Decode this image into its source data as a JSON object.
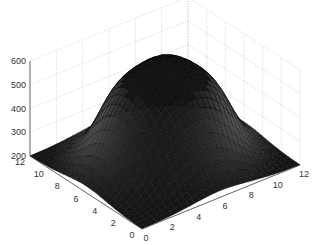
{
  "chart_data": {
    "type": "surface3d",
    "title": "",
    "xlabel": "",
    "ylabel": "",
    "zlabel": "",
    "x_ticks": [
      0,
      2,
      4,
      6,
      8,
      10,
      12
    ],
    "y_ticks": [
      0,
      2,
      4,
      6,
      8,
      10,
      12
    ],
    "z_ticks": [
      200,
      300,
      400,
      500,
      600
    ],
    "xlim": [
      0,
      12
    ],
    "ylim": [
      0,
      12
    ],
    "zlim": [
      200,
      600
    ],
    "grid": true,
    "colormap": "gray",
    "surface": {
      "base_level": 200,
      "peak_level": 590,
      "center": [
        6,
        6
      ],
      "plateau_radius": 2.6,
      "falloff_width": 1.6
    }
  },
  "colors": {
    "background": "#ffffff",
    "grid": "#b8b8b8",
    "axis": "#444444",
    "tick_text": "#333333"
  }
}
